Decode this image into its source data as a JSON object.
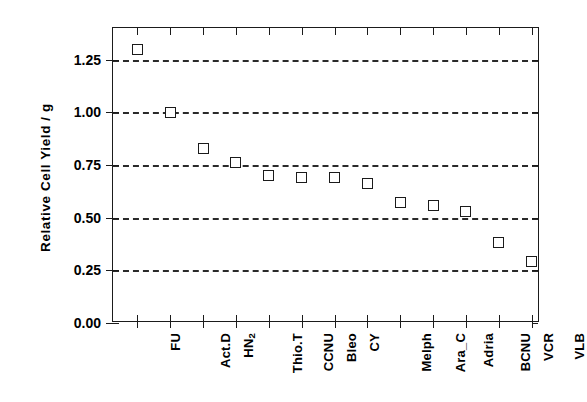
{
  "chart_data": {
    "type": "scatter",
    "title": "",
    "subtitle": "",
    "xlabel": "",
    "ylabel": "Relative Cell Yield / g",
    "categories": [
      "FU",
      "Act.D",
      "HN2",
      "Thio.T",
      "CCNU",
      "Bleo",
      "CY",
      "Melph",
      "Ara_C",
      "Adria",
      "BCNU",
      "VCR",
      "VLB"
    ],
    "category_labels_html": [
      "FU",
      "Act.D",
      "HN<sub>2</sub>",
      "Thio.T",
      "CCNU",
      "Bleo",
      "CY",
      "Melph",
      "Ara_C",
      "Adria",
      "BCNU",
      "VCR",
      "VLB"
    ],
    "values": [
      1.3,
      1.0,
      0.83,
      0.76,
      0.7,
      0.69,
      0.69,
      0.66,
      0.57,
      0.56,
      0.53,
      0.38,
      0.29
    ],
    "ylim": [
      0.0,
      1.4
    ],
    "yticks": [
      0.0,
      0.25,
      0.5,
      0.75,
      1.0,
      1.25
    ],
    "ytick_labels": [
      "0.00",
      "0.25",
      "0.50",
      "0.75",
      "1.00",
      "1.25"
    ],
    "grid": "horizontal-dashed",
    "legend": "none",
    "marker": "open-square",
    "marker_color": "#1b1b1b",
    "marker_fill": "#ffffff",
    "axis_color": "#1b1b1b",
    "background": "#ffffff"
  }
}
